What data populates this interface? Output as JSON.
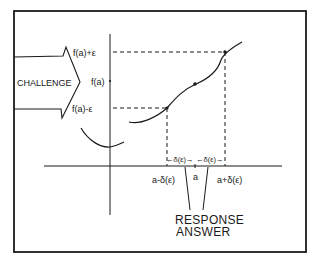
{
  "diagram": {
    "challenge": {
      "label": "CHALLENGE"
    },
    "y_labels": {
      "upper": "f(a)+ε",
      "center": "f(a)",
      "lower": "f(a)-ε"
    },
    "x_labels": {
      "left": "a-δ(ε)",
      "center": "a",
      "right": "a+δ(ε)"
    },
    "interval_labels": {
      "left": "←δ(ε)→",
      "right": "←δ(ε)→"
    },
    "response": {
      "line1": "RESPONSE",
      "line2": "ANSWER"
    },
    "colors": {
      "ink": "#1a1a1a",
      "background": "#ffffff"
    }
  }
}
